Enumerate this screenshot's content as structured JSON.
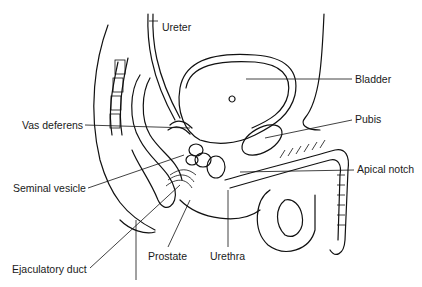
{
  "diagram": {
    "type": "anatomical line drawing",
    "labels": [
      {
        "id": "ureter",
        "text": "Ureter",
        "x": 162,
        "y": 21
      },
      {
        "id": "bladder",
        "text": "Bladder",
        "x": 355,
        "y": 74
      },
      {
        "id": "vas-deferens",
        "text": "Vas deferens",
        "x": 22,
        "y": 119
      },
      {
        "id": "pubis",
        "text": "Pubis",
        "x": 355,
        "y": 114
      },
      {
        "id": "seminal-vesicle",
        "text": "Seminal vesicle",
        "x": 13,
        "y": 183
      },
      {
        "id": "apical-notch",
        "text": "Apical notch",
        "x": 357,
        "y": 164
      },
      {
        "id": "prostate",
        "text": "Prostate",
        "x": 148,
        "y": 251
      },
      {
        "id": "urethra",
        "text": "Urethra",
        "x": 210,
        "y": 251
      },
      {
        "id": "ejaculatory-duct",
        "text": "Ejaculatory duct",
        "x": 12,
        "y": 264
      }
    ],
    "colors": {
      "ink": "#111111",
      "background": "#ffffff",
      "stipple": "#555555"
    }
  }
}
